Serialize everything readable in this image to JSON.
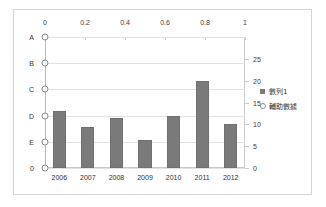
{
  "chart_data": {
    "type": "bar",
    "title": "",
    "subtitle": "",
    "xlabel": "",
    "ylabel": "",
    "grid": true,
    "legend_position": "right",
    "categories": [
      "2006",
      "2007",
      "2008",
      "2009",
      "2010",
      "2011",
      "2012"
    ],
    "series": [
      {
        "name": "數列1",
        "type": "bar",
        "axis": "secondary-right",
        "color": "#7a7a7a",
        "values": [
          13,
          9.5,
          11.5,
          6.5,
          12,
          20,
          10
        ]
      },
      {
        "name": "輔助數據",
        "type": "scatter",
        "axis": "primary-left",
        "color": "#8c8c8c",
        "x_values": [
          0,
          0,
          0,
          0,
          0,
          0
        ],
        "point_categories": [
          "A",
          "B",
          "C",
          "D",
          "E",
          "0"
        ]
      }
    ],
    "primary_axis": {
      "position": "left",
      "type": "category",
      "tick_labels": [
        "A",
        "B",
        "C",
        "D",
        "E",
        "0"
      ]
    },
    "secondary_value_axis": {
      "position": "right",
      "ylim": [
        0,
        30
      ],
      "tick_labels": [
        "0",
        "5",
        "10",
        "15",
        "20",
        "25"
      ],
      "tick_values": [
        0,
        5,
        10,
        15,
        20,
        25
      ]
    },
    "top_axis": {
      "position": "top",
      "xlim": [
        0,
        1
      ],
      "tick_labels": [
        "0",
        "0.2",
        "0.4",
        "0.6",
        "0.8",
        "1"
      ],
      "tick_values": [
        0,
        0.2,
        0.4,
        0.6,
        0.8,
        1
      ]
    },
    "legend_entries": [
      {
        "label": "數列1",
        "marker": "square-marker",
        "color": "#7a7a7a"
      },
      {
        "label": "輔助數據",
        "marker": "circle-marker",
        "color": "#8c8c8c"
      }
    ]
  }
}
